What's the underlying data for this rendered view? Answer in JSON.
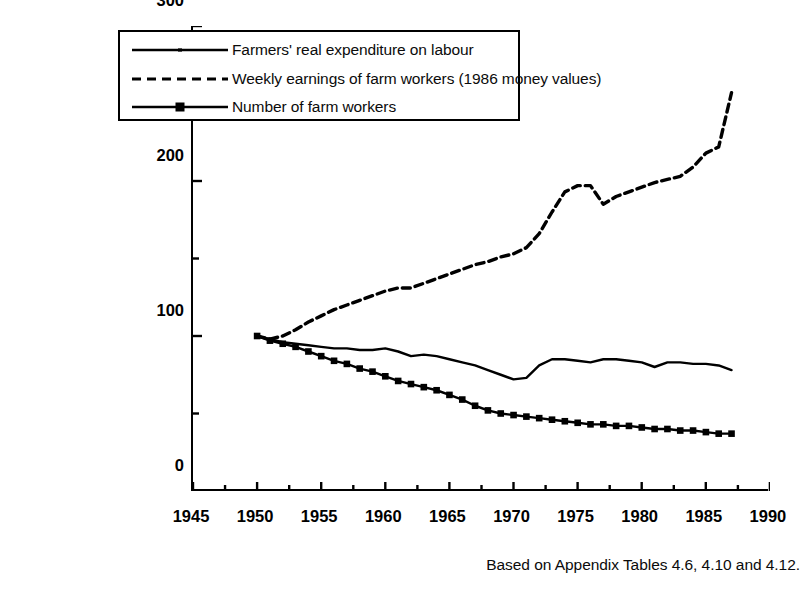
{
  "figure": {
    "title_fragment": "",
    "footnote": "Based on Appendix Tables 4.6, 4.10 and 4.12."
  },
  "legend": {
    "items": [
      {
        "label": "Farmers' real expenditure on labour",
        "style": "solid",
        "marker": "none"
      },
      {
        "label": "Weekly earnings of farm workers (1986 money values)",
        "style": "dashed",
        "marker": "none"
      },
      {
        "label": "Number of farm workers",
        "style": "solid",
        "marker": "square"
      }
    ]
  },
  "axes": {
    "y_title": "Index (1950=100)",
    "y_ticks": [
      "0",
      "100",
      "200",
      "300"
    ],
    "x_ticks": [
      "1945",
      "1950",
      "1955",
      "1960",
      "1965",
      "1970",
      "1975",
      "1980",
      "1985",
      "1990"
    ]
  },
  "chart_data": {
    "type": "line",
    "title": "",
    "xlabel": "",
    "ylabel": "Index (1950=100)",
    "xlim": [
      1945,
      1990
    ],
    "ylim": [
      0,
      300
    ],
    "grid": false,
    "legend_position": "upper-left-inside",
    "x": [
      1950,
      1951,
      1952,
      1953,
      1954,
      1955,
      1956,
      1957,
      1958,
      1959,
      1960,
      1961,
      1962,
      1963,
      1964,
      1965,
      1966,
      1967,
      1968,
      1969,
      1970,
      1971,
      1972,
      1973,
      1974,
      1975,
      1976,
      1977,
      1978,
      1979,
      1980,
      1981,
      1982,
      1983,
      1984,
      1985,
      1986,
      1987
    ],
    "series": [
      {
        "name": "Farmers' real expenditure on labour",
        "style": "solid",
        "marker": "none",
        "values": [
          100,
          98,
          96,
          95,
          94,
          93,
          92,
          92,
          91,
          91,
          92,
          90,
          87,
          88,
          87,
          85,
          83,
          81,
          78,
          75,
          72,
          73,
          81,
          85,
          85,
          84,
          83,
          85,
          85,
          84,
          83,
          80,
          83,
          83,
          82,
          82,
          81,
          78
        ]
      },
      {
        "name": "Weekly earnings of farm workers (1986 money values)",
        "style": "dashed",
        "marker": "none",
        "values": [
          100,
          98,
          100,
          104,
          109,
          113,
          117,
          120,
          123,
          126,
          129,
          131,
          131,
          134,
          137,
          140,
          143,
          146,
          148,
          151,
          153,
          157,
          166,
          180,
          193,
          197,
          197,
          185,
          190,
          193,
          196,
          199,
          201,
          203,
          209,
          218,
          222,
          257
        ]
      },
      {
        "name": "Number of farm workers",
        "style": "solid",
        "marker": "square",
        "values": [
          100,
          97,
          95,
          93,
          90,
          87,
          84,
          82,
          79,
          77,
          74,
          71,
          69,
          67,
          65,
          62,
          59,
          55,
          52,
          50,
          49,
          48,
          47,
          46,
          45,
          44,
          43,
          43,
          42,
          42,
          41,
          40,
          40,
          39,
          39,
          38,
          37,
          37
        ]
      }
    ]
  }
}
